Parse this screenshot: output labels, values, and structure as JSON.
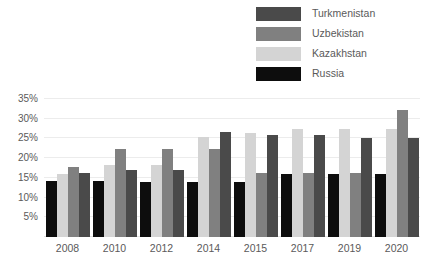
{
  "chart_data": {
    "type": "bar",
    "title": "",
    "subtitle": "",
    "xlabel": "",
    "ylabel": "",
    "categories": [
      "2008",
      "2010",
      "2012",
      "2014",
      "2015",
      "2017",
      "2019",
      "2020"
    ],
    "series": [
      {
        "name": "Russia",
        "color": "#0d0d0d",
        "values": [
          14.3,
          14.3,
          14.0,
          14.0,
          14.0,
          16.0,
          16.1,
          16.1
        ]
      },
      {
        "name": "Kazakhstan",
        "color": "#d4d4d4",
        "values": [
          16.1,
          18.2,
          18.2,
          25.4,
          26.4,
          27.4,
          27.4,
          27.4
        ]
      },
      {
        "name": "Uzbekistan",
        "color": "#808080",
        "values": [
          17.8,
          22.3,
          22.3,
          22.3,
          16.2,
          16.2,
          16.2,
          32.3
        ]
      },
      {
        "name": "Turkmenistan",
        "color": "#4a4a4a",
        "values": [
          16.2,
          17.1,
          17.1,
          26.6,
          26.0,
          26.0,
          25.2,
          25.2
        ]
      }
    ],
    "ylim": [
      0,
      35
    ],
    "ytick_values": [
      5,
      10,
      15,
      20,
      25,
      30,
      35
    ],
    "ytick_labels": [
      "5%",
      "10%",
      "15%",
      "20%",
      "25%",
      "30%",
      "35%"
    ],
    "grid": true,
    "legend_position": "top-right",
    "bar_order_in_group": [
      "Russia",
      "Kazakhstan",
      "Uzbekistan",
      "Turkmenistan"
    ]
  },
  "legend": {
    "items": [
      {
        "label": "Turkmenistan",
        "color": "#4a4a4a"
      },
      {
        "label": "Uzbekistan",
        "color": "#808080"
      },
      {
        "label": "Kazakhstan",
        "color": "#d4d4d4"
      },
      {
        "label": "Russia",
        "color": "#0d0d0d"
      }
    ]
  }
}
